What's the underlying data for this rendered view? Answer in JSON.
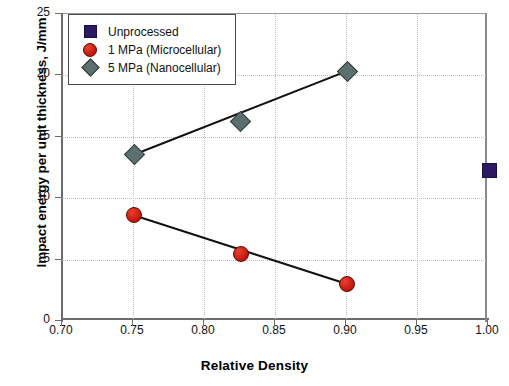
{
  "chart_data": {
    "type": "scatter",
    "title": "",
    "xlabel": "Relative Density",
    "ylabel": "Impact energy per unit thickness, J/mm",
    "xlim": [
      0.7,
      1.0
    ],
    "ylim": [
      0,
      25
    ],
    "xticks": [
      "0.70",
      "0.75",
      "0.80",
      "0.85",
      "0.90",
      "0.95",
      "1.00"
    ],
    "xtick_values": [
      0.7,
      0.75,
      0.8,
      0.85,
      0.9,
      0.95,
      1.0
    ],
    "yticks": [
      "0",
      "5",
      "10",
      "15",
      "20",
      "25"
    ],
    "ytick_values": [
      0,
      5,
      10,
      15,
      20,
      25
    ],
    "grid": true,
    "legend_position": "top-left",
    "series": [
      {
        "name": "Unprocessed",
        "marker": "square",
        "color": "#2e1a63",
        "trendline": false,
        "points": [
          {
            "x": 1.0,
            "y": 12.3
          }
        ]
      },
      {
        "name": "1 MPa (Microcellular)",
        "marker": "circle",
        "color": "#cf1f14",
        "trendline": true,
        "points": [
          {
            "x": 0.75,
            "y": 8.7
          },
          {
            "x": 0.825,
            "y": 5.5
          },
          {
            "x": 0.9,
            "y": 3.1
          }
        ]
      },
      {
        "name": "5 MPa (Nanocellular)",
        "marker": "diamond",
        "color": "#5d7070",
        "trendline": true,
        "points": [
          {
            "x": 0.75,
            "y": 13.6
          },
          {
            "x": 0.825,
            "y": 16.3
          },
          {
            "x": 0.9,
            "y": 20.4
          }
        ]
      }
    ]
  }
}
